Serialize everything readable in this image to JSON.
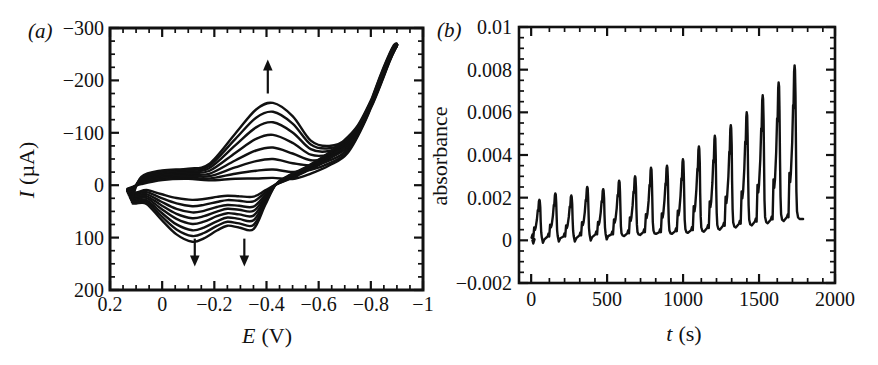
{
  "figure": {
    "background": "#ffffff",
    "ink": "#111111"
  },
  "chart_data": [
    {
      "panel_label": "(a)",
      "type": "line",
      "subtype": "cyclic-voltammogram",
      "xlabel": {
        "variable": "E",
        "unit": "(V)"
      },
      "ylabel": {
        "variable": "I",
        "unit": "(µA)"
      },
      "x_axis": {
        "min": 0.2,
        "max": -1.0,
        "reversed": true,
        "major_tick_step": 0.2,
        "minor_tick_step": 0.05,
        "tick_values": [
          0.2,
          0,
          -0.2,
          -0.4,
          -0.6,
          -0.8,
          -1.0
        ],
        "tick_labels": [
          "0.2",
          "0",
          "−0.2",
          "−0.4",
          "−0.6",
          "−0.8",
          "−1"
        ]
      },
      "y_axis": {
        "min": -300,
        "max": 200,
        "inverted_display": true,
        "major_tick_step": 100,
        "minor_tick_step": 25,
        "tick_values": [
          -300,
          -200,
          -100,
          0,
          100,
          200
        ],
        "tick_labels": [
          "−300",
          "−200",
          "−100",
          "0",
          "100",
          "200"
        ]
      },
      "cycles": {
        "count": 8,
        "cathodic_peak_E": -0.425,
        "cathodic_peak_uA": [
          -14,
          -30,
          -50,
          -72,
          -96,
          -120,
          -140,
          -157
        ],
        "anodic_peak_E": -0.115,
        "anodic_peak_uA": [
          28,
          40,
          52,
          63,
          74,
          86,
          97,
          108
        ],
        "anodic_shoulder_E": -0.35,
        "anodic_shoulder_uA": [
          22,
          31,
          41,
          49,
          58,
          67,
          76,
          84
        ],
        "switching_potential_V": -0.9,
        "current_at_switch_uA": -267
      },
      "arrows": [
        {
          "direction": "up",
          "E": -0.405,
          "from_uA": -175,
          "to_uA": -240
        },
        {
          "direction": "down",
          "E": -0.125,
          "from_uA": 102,
          "to_uA": 155
        },
        {
          "direction": "down",
          "E": -0.315,
          "from_uA": 102,
          "to_uA": 155
        }
      ]
    },
    {
      "panel_label": "(b)",
      "type": "line",
      "subtype": "absorbance-time-series",
      "xlabel": {
        "variable": "t",
        "unit": "(s)"
      },
      "ylabel_text": "absorbance",
      "x_axis": {
        "min": -80,
        "max": 2000,
        "major_tick_step": 500,
        "minor_tick_step": 100,
        "tick_values": [
          0,
          500,
          1000,
          1500,
          2000
        ],
        "tick_labels": [
          "0",
          "500",
          "1000",
          "1500",
          "2000"
        ]
      },
      "y_axis": {
        "min": -0.002,
        "max": 0.01,
        "major_tick_step": 0.002,
        "minor_tick_step": 0.0005,
        "tick_values": [
          0.01,
          0.008,
          0.006,
          0.004,
          0.002,
          0,
          -0.002
        ],
        "tick_labels": [
          "0.01",
          "0.008",
          "0.006",
          "0.004",
          "0.002",
          "0",
          "−0.002"
        ]
      },
      "oscillations": {
        "peak_times_s": [
          55,
          160,
          265,
          370,
          475,
          580,
          685,
          790,
          895,
          1000,
          1105,
          1210,
          1315,
          1420,
          1525,
          1630,
          1735
        ],
        "peak_absorbance": [
          0.0019,
          0.0022,
          0.0021,
          0.0025,
          0.0024,
          0.0028,
          0.003,
          0.0034,
          0.0035,
          0.0038,
          0.0044,
          0.0049,
          0.0054,
          0.006,
          0.0068,
          0.0074,
          0.0082
        ],
        "baseline_absorbance": [
          5e-05,
          0.0001,
          0.0001,
          0.00015,
          0.0002,
          0.0002,
          0.00025,
          0.0003,
          0.0003,
          0.00035,
          0.0004,
          0.0005,
          0.0006,
          0.0007,
          0.0008,
          0.0009,
          0.001
        ],
        "trace_start_s": 8,
        "trace_end_s": 1790,
        "trace_end_absorbance": 0.001
      }
    }
  ]
}
